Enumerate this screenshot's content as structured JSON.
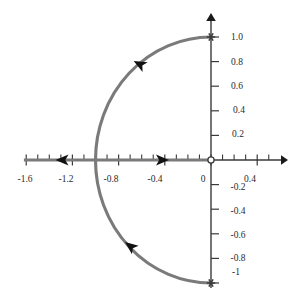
{
  "chart_data": {
    "type": "line",
    "title": "",
    "subtitle": "",
    "xlabel": "",
    "ylabel": "",
    "xlim": [
      -1.72,
      0.64
    ],
    "ylim": [
      -1.19,
      1.19
    ],
    "grid": false,
    "legend": null,
    "x_ticks_major": [
      -1.6,
      -1.2,
      -0.8,
      -0.4,
      0,
      0.4
    ],
    "x_tick_labels": [
      "-1.6",
      "-1.2",
      "-0.8",
      "-0.4",
      "0",
      "0.4"
    ],
    "x_ticks_minor": [
      -1.5,
      -1.4,
      -1.3,
      -1.1,
      -1.0,
      -0.9,
      -0.7,
      -0.6,
      -0.5,
      -0.3,
      -0.2,
      -0.1,
      0.1,
      0.2,
      0.3,
      0.5
    ],
    "y_ticks_major": [
      1.0,
      0.8,
      0.6,
      0.4,
      0.2,
      -0.2,
      -0.4,
      -0.6,
      -0.8,
      -1.0
    ],
    "y_tick_labels": [
      "1.0",
      "0.8",
      "0.6",
      "0.4",
      "0.2",
      "-0.2",
      "-0.4",
      "-0.6",
      "-0.8",
      "-1"
    ],
    "series": [
      {
        "name": "left-half-unit-semicircle",
        "kind": "arc",
        "color": "#7a7a7a",
        "linewidth": 3,
        "center": [
          0,
          0
        ],
        "radius": 1.0,
        "start_point": [
          0,
          -1.0
        ],
        "end_point": [
          0,
          1.0
        ],
        "start_angle_deg": -90,
        "end_angle_deg": 90,
        "sweep": "through -1 (left half plane)",
        "direction": "counterclockwise-from-bottom-to-top-through-minus-one"
      },
      {
        "name": "negative-real-axis-segment",
        "kind": "segment",
        "color": "#7a7a7a",
        "linewidth": 3,
        "points": [
          [
            -1.62,
            0
          ],
          [
            0,
            0
          ]
        ],
        "direction_markers": "bidirectional"
      }
    ],
    "markers": [
      {
        "name": "endpoint-top",
        "symbol": "asterisk-cross",
        "x": 0,
        "y": 1.0,
        "color": "#3a3a3a"
      },
      {
        "name": "endpoint-bottom",
        "symbol": "asterisk-cross",
        "x": 0,
        "y": -1.0,
        "color": "#3a3a3a"
      },
      {
        "name": "origin-open-circle",
        "symbol": "open-circle",
        "x": 0,
        "y": 0,
        "color": "#3a3a3a"
      }
    ],
    "annotations": [
      {
        "name": "arrow-upper-arc",
        "type": "direction-arrow",
        "x": -0.62,
        "y": 0.78,
        "points": "up-left",
        "angle_deg": 208
      },
      {
        "name": "arrow-lower-arc",
        "type": "direction-arrow",
        "x": -0.7,
        "y": -0.7,
        "points": "up-left",
        "angle_deg": 218
      },
      {
        "name": "arrow-axis-left",
        "type": "direction-arrow",
        "x": -1.29,
        "y": 0,
        "points": "left",
        "angle_deg": 180
      },
      {
        "name": "arrow-axis-right",
        "type": "direction-arrow",
        "x": -0.42,
        "y": 0,
        "points": "right",
        "angle_deg": 0
      }
    ],
    "axes": {
      "x_axis_arrow": "right",
      "y_axis_arrow": "up",
      "axis_color": "#3a3a3a"
    },
    "colors": {
      "curve": "#7a7a7a",
      "axis": "#3a3a3a",
      "text": "#2a2a2a",
      "background": "#ffffff",
      "arrow": "#111111"
    }
  },
  "meta": {
    "x_label_positions": [
      {
        "label": "-1.6",
        "cx": 25,
        "cy": 182
      },
      {
        "label": "-1.2",
        "cx": 66,
        "cy": 182
      },
      {
        "label": "-0.8",
        "cx": 111,
        "cy": 182
      },
      {
        "label": "-0.4",
        "cx": 155,
        "cy": 182
      },
      {
        "label": "0",
        "cx": 203,
        "cy": 182
      },
      {
        "label": "0.4",
        "cx": 250,
        "cy": 182
      }
    ],
    "y_label_positions": [
      {
        "label": "1.0",
        "cx": 237,
        "cy": 37
      },
      {
        "label": "0.8",
        "cx": 237,
        "cy": 62
      },
      {
        "label": "0.6",
        "cx": 237,
        "cy": 86
      },
      {
        "label": "0.4",
        "cx": 239,
        "cy": 110
      },
      {
        "label": "0.2",
        "cx": 238,
        "cy": 134
      },
      {
        "label": "-0.2",
        "cx": 238,
        "cy": 187
      },
      {
        "label": "-0.4",
        "cx": 238,
        "cy": 211
      },
      {
        "label": "-0.6",
        "cx": 238,
        "cy": 235
      },
      {
        "label": "-0.8",
        "cx": 238,
        "cy": 258
      },
      {
        "label": "-1",
        "cx": 236,
        "cy": 272
      }
    ]
  }
}
